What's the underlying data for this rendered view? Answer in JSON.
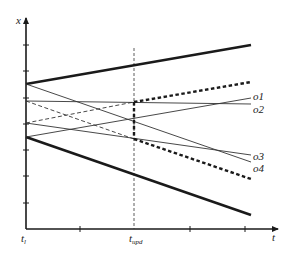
{
  "diagram": {
    "type": "time-interval-diagram",
    "axes": {
      "y_label": "x",
      "x_label": "t",
      "x_tick_labels": [
        {
          "main": "t",
          "sub": "l"
        },
        {
          "main": "t",
          "sub": "upd"
        }
      ],
      "y_ticks_count": 8,
      "x_ticks_count": 5
    },
    "curves": [
      {
        "name": "upper-bound",
        "style": "bold-solid"
      },
      {
        "name": "lower-bound",
        "style": "bold-solid"
      },
      {
        "name": "updated-upper-bound",
        "style": "bold-dotted"
      },
      {
        "name": "updated-lower-bound",
        "style": "bold-dotted"
      },
      {
        "name": "o1",
        "style": "thin-solid"
      },
      {
        "name": "o2",
        "style": "thin-solid"
      },
      {
        "name": "o3",
        "style": "thin-solid"
      },
      {
        "name": "o4",
        "style": "thin-solid"
      }
    ],
    "series_labels": [
      "o1",
      "o2",
      "o3",
      "o4"
    ],
    "colors": {
      "line": "#1a1a1a",
      "background": "#ffffff"
    }
  }
}
